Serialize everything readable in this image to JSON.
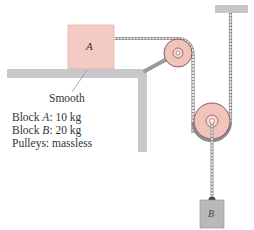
{
  "diagram": {
    "type": "physics-pulley-system",
    "blocks": [
      {
        "id": "A",
        "label": "A",
        "mass_text": "10 kg",
        "on": "table",
        "color": "#f3cbc3"
      },
      {
        "id": "B",
        "label": "B",
        "mass_text": "20 kg",
        "hanging": true,
        "color": "#b8b8b8"
      }
    ],
    "surface_label": "Smooth",
    "specs": [
      {
        "prefix": "Block ",
        "var": "A",
        "suffix": ": 10 kg"
      },
      {
        "prefix": "Block ",
        "var": "B",
        "suffix": ": 20 kg"
      },
      {
        "prefix": "Pulleys: massless",
        "var": "",
        "suffix": ""
      }
    ],
    "pulleys": [
      {
        "name": "fixed-pulley",
        "mounted_on": "table-edge-strut"
      },
      {
        "name": "movable-pulley",
        "supports": "B"
      }
    ],
    "colors": {
      "block_a": "#f3cbc3",
      "pulley": "#f1c4bb",
      "pulley_rim": "#8a5a55",
      "table": "#c9c9c9",
      "rope": "#8c8c8c",
      "block_b": "#b9b9b9",
      "ceiling": "#c6c6c6"
    }
  }
}
